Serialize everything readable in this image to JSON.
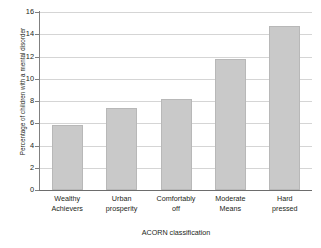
{
  "chart_data": {
    "type": "bar",
    "title": "",
    "subtitle": "",
    "xlabel": "ACORN classification",
    "ylabel": "Percentage of children with a mental disorder",
    "categories": [
      "Wealthy Achievers",
      "Urban prosperity",
      "Comfortably off",
      "Moderate Means",
      "Hard pressed"
    ],
    "category_lines": [
      [
        "Wealthy",
        "Achievers"
      ],
      [
        "Urban",
        "prosperity"
      ],
      [
        "Comfortably",
        "off"
      ],
      [
        "Moderate",
        "Means"
      ],
      [
        "Hard",
        "pressed"
      ]
    ],
    "values": [
      5.8,
      7.4,
      8.2,
      11.8,
      14.7
    ],
    "ylim": [
      0,
      16
    ],
    "yticks": [
      0,
      2,
      4,
      6,
      8,
      10,
      12,
      14,
      16
    ],
    "ytick_labels": [
      "0",
      "2",
      "4",
      "6",
      "8",
      "10",
      "12",
      "14",
      "16"
    ],
    "grid": true,
    "grid_axis": "y",
    "legend": false,
    "legend_position": "none",
    "bar_color": "#c9c9c9",
    "bar_border_color": "#b8b8b8",
    "grid_color": "#d5d5d5",
    "axis_color": "#808080",
    "text_color": "#231f20",
    "background_color": "#ffffff"
  }
}
